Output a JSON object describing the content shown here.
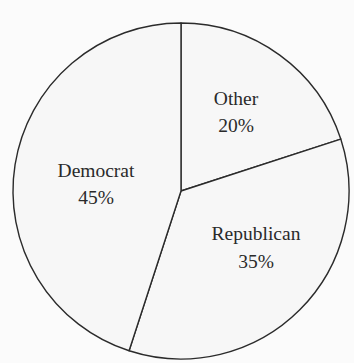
{
  "chart_data": {
    "type": "pie",
    "title": "",
    "categories": [
      "Other",
      "Republican",
      "Democrat"
    ],
    "values": [
      20,
      35,
      45
    ],
    "labels": [
      "Other 20%",
      "Republican 35%",
      "Democrat 45%"
    ],
    "start_angle_deg": 0,
    "direction": "clockwise",
    "legend": "none (labels inside slices)",
    "colors": {
      "fill": "#f7f7f7",
      "stroke": "#2b2b2b",
      "background": "#fbfbfb"
    }
  },
  "slices": [
    {
      "name": "Other",
      "pct": "20%"
    },
    {
      "name": "Republican",
      "pct": "35%"
    },
    {
      "name": "Democrat",
      "pct": "45%"
    }
  ]
}
